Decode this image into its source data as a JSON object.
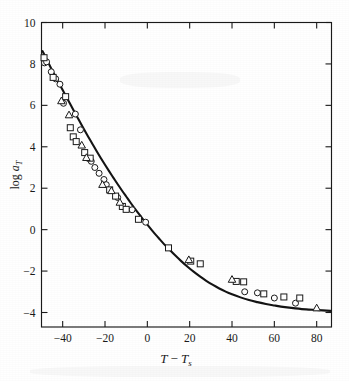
{
  "figure": {
    "name": "wlf-shift-factor-plot",
    "background": "#ffffff",
    "ink_color": "#1a1a1a"
  },
  "chart_data": {
    "type": "scatter",
    "title": "",
    "subtitle": "",
    "xlabel": "T − T_s",
    "xlabel_parts": {
      "var1": "T",
      "minus": "−",
      "var2": "T",
      "sub2": "s"
    },
    "ylabel": "log a_T",
    "ylabel_parts": {
      "log": "log",
      "var": "a",
      "sub": "T"
    },
    "xlim": [
      -50,
      87
    ],
    "ylim": [
      -4.7,
      10
    ],
    "xticks": [
      -40,
      -20,
      0,
      20,
      40,
      60,
      80
    ],
    "xtick_labels": [
      "−40",
      "−20",
      "0",
      "20",
      "40",
      "60",
      "80"
    ],
    "yticks": [
      10,
      8,
      6,
      4,
      2,
      0,
      -2,
      -4
    ],
    "ytick_labels": [
      "10",
      "8",
      "6",
      "4",
      "2",
      "0",
      "−2",
      "−4"
    ],
    "grid": false,
    "legend": "none",
    "tick_direction": "in",
    "frame": "box",
    "curve_label": "WLF master curve",
    "curve": [
      {
        "x": -49.5,
        "y": 8.62
      },
      {
        "x": -48.0,
        "y": 8.3
      },
      {
        "x": -46.0,
        "y": 7.9
      },
      {
        "x": -44.0,
        "y": 7.5
      },
      {
        "x": -42.0,
        "y": 7.12
      },
      {
        "x": -40.0,
        "y": 6.74
      },
      {
        "x": -38.0,
        "y": 6.36
      },
      {
        "x": -36.0,
        "y": 5.98
      },
      {
        "x": -34.0,
        "y": 5.6
      },
      {
        "x": -32.0,
        "y": 5.23
      },
      {
        "x": -30.0,
        "y": 4.86
      },
      {
        "x": -28.0,
        "y": 4.5
      },
      {
        "x": -26.0,
        "y": 4.15
      },
      {
        "x": -24.0,
        "y": 3.8
      },
      {
        "x": -22.0,
        "y": 3.46
      },
      {
        "x": -20.0,
        "y": 3.13
      },
      {
        "x": -18.0,
        "y": 2.81
      },
      {
        "x": -16.0,
        "y": 2.5
      },
      {
        "x": -14.0,
        "y": 2.19
      },
      {
        "x": -12.0,
        "y": 1.89
      },
      {
        "x": -10.0,
        "y": 1.6
      },
      {
        "x": -8.0,
        "y": 1.31
      },
      {
        "x": -6.0,
        "y": 1.03
      },
      {
        "x": -4.0,
        "y": 0.76
      },
      {
        "x": -2.0,
        "y": 0.5
      },
      {
        "x": 0.0,
        "y": 0.24
      },
      {
        "x": 2.0,
        "y": -0.01
      },
      {
        "x": 4.0,
        "y": -0.25
      },
      {
        "x": 6.0,
        "y": -0.48
      },
      {
        "x": 8.0,
        "y": -0.71
      },
      {
        "x": 10.0,
        "y": -0.92
      },
      {
        "x": 13.0,
        "y": -1.23
      },
      {
        "x": 16.0,
        "y": -1.52
      },
      {
        "x": 19.0,
        "y": -1.79
      },
      {
        "x": 22.0,
        "y": -2.04
      },
      {
        "x": 25.0,
        "y": -2.27
      },
      {
        "x": 28.0,
        "y": -2.48
      },
      {
        "x": 31.0,
        "y": -2.67
      },
      {
        "x": 34.0,
        "y": -2.84
      },
      {
        "x": 37.0,
        "y": -2.99
      },
      {
        "x": 40.0,
        "y": -3.12
      },
      {
        "x": 44.0,
        "y": -3.27
      },
      {
        "x": 48.0,
        "y": -3.4
      },
      {
        "x": 52.0,
        "y": -3.5
      },
      {
        "x": 56.0,
        "y": -3.59
      },
      {
        "x": 60.0,
        "y": -3.66
      },
      {
        "x": 65.0,
        "y": -3.74
      },
      {
        "x": 70.0,
        "y": -3.8
      },
      {
        "x": 75.0,
        "y": -3.85
      },
      {
        "x": 80.0,
        "y": -3.88
      },
      {
        "x": 86.5,
        "y": -3.92
      }
    ],
    "series": [
      {
        "name": "circle-series",
        "marker": "circle",
        "points": [
          {
            "x": -48.6,
            "y": 8.05
          },
          {
            "x": -47.6,
            "y": 8.1
          },
          {
            "x": -45.4,
            "y": 7.62
          },
          {
            "x": -43.3,
            "y": 7.28
          },
          {
            "x": -41.3,
            "y": 7.02
          },
          {
            "x": -39.6,
            "y": 6.1
          },
          {
            "x": -34.0,
            "y": 5.58
          },
          {
            "x": -31.6,
            "y": 4.82
          },
          {
            "x": -26.5,
            "y": 3.3
          },
          {
            "x": -24.8,
            "y": 3.0
          },
          {
            "x": -22.8,
            "y": 2.72
          },
          {
            "x": -20.5,
            "y": 2.42
          },
          {
            "x": -19.4,
            "y": 2.17
          },
          {
            "x": -14.0,
            "y": 1.55
          },
          {
            "x": -7.2,
            "y": 0.96
          },
          {
            "x": -0.8,
            "y": 0.36
          },
          {
            "x": 46.0,
            "y": -3.0
          },
          {
            "x": 52.0,
            "y": -3.05
          },
          {
            "x": 60.0,
            "y": -3.3
          },
          {
            "x": 70.0,
            "y": -3.55
          }
        ]
      },
      {
        "name": "square-series",
        "marker": "square",
        "points": [
          {
            "x": -48.8,
            "y": 8.3
          },
          {
            "x": -44.5,
            "y": 7.35
          },
          {
            "x": -38.6,
            "y": 6.42
          },
          {
            "x": -36.4,
            "y": 4.92
          },
          {
            "x": -35.0,
            "y": 4.48
          },
          {
            "x": -33.6,
            "y": 4.25
          },
          {
            "x": -29.6,
            "y": 3.72
          },
          {
            "x": -27.0,
            "y": 3.45
          },
          {
            "x": -17.8,
            "y": 1.92
          },
          {
            "x": -15.0,
            "y": 1.62
          },
          {
            "x": -11.8,
            "y": 1.12
          },
          {
            "x": -10.0,
            "y": 0.98
          },
          {
            "x": -4.2,
            "y": 0.5
          },
          {
            "x": 10.0,
            "y": -0.88
          },
          {
            "x": 20.5,
            "y": -1.52
          },
          {
            "x": 25.0,
            "y": -1.65
          },
          {
            "x": 42.0,
            "y": -2.5
          },
          {
            "x": 45.5,
            "y": -2.52
          },
          {
            "x": 55.0,
            "y": -3.1
          },
          {
            "x": 64.5,
            "y": -3.25
          },
          {
            "x": 72.0,
            "y": -3.3
          }
        ]
      },
      {
        "name": "triangle-series",
        "marker": "triangle",
        "points": [
          {
            "x": -40.6,
            "y": 6.22
          },
          {
            "x": -37.0,
            "y": 5.54
          },
          {
            "x": -31.0,
            "y": 4.08
          },
          {
            "x": -28.8,
            "y": 3.48
          },
          {
            "x": -21.2,
            "y": 2.18
          },
          {
            "x": -17.0,
            "y": 1.88
          },
          {
            "x": -13.0,
            "y": 1.32
          },
          {
            "x": 19.6,
            "y": -1.45
          },
          {
            "x": 40.0,
            "y": -2.4
          },
          {
            "x": 80.0,
            "y": -3.78
          }
        ]
      }
    ]
  }
}
